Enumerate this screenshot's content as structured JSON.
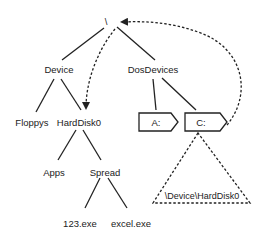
{
  "diagram": {
    "root": {
      "label": "\\"
    },
    "nodes": {
      "device": "Device",
      "dosdevices": "DosDevices",
      "floppys": "Floppys",
      "harddisk0": "HardDisk0",
      "apps": "Apps",
      "spread": "Spread",
      "exe123": "123.exe",
      "excel": "excel.exe",
      "a_drive": "A:",
      "c_drive": "C:",
      "symlink_target": "\\Device\\HardDisk0"
    },
    "colors": {
      "line": "#222222",
      "background": "#ffffff"
    }
  }
}
